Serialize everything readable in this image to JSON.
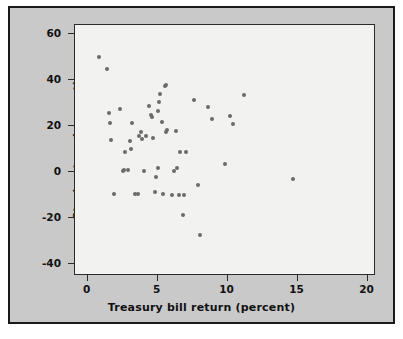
{
  "figure": {
    "background_color": "#c9c9c9",
    "plot_background_color": "#f2f2f0",
    "border_color": "#1a1a1a",
    "point_color": "#6b6b6b"
  },
  "chart_data": {
    "type": "scatter",
    "title": "",
    "xlabel": "Treasury bill return (percent)",
    "ylabel": "Stock return (percent)",
    "xlim": [
      -0.9,
      20.6
    ],
    "ylim": [
      -45,
      64
    ],
    "xticks": [
      0,
      5,
      10,
      15,
      20
    ],
    "xtick_labels": [
      "0",
      "5",
      "10",
      "15",
      "20"
    ],
    "yticks": [
      60,
      40,
      20,
      0,
      -20,
      -40
    ],
    "ytick_labels": [
      "60",
      "40",
      "20",
      "0",
      "-20",
      "-40"
    ],
    "grid": false,
    "legend": null,
    "marker": "circle",
    "n_points": 56,
    "x": [
      0.8,
      1.4,
      1.5,
      1.6,
      1.7,
      1.9,
      2.3,
      2.5,
      2.7,
      2.9,
      3.0,
      3.1,
      3.2,
      3.4,
      3.6,
      3.7,
      3.8,
      3.9,
      4.0,
      4.2,
      4.4,
      4.5,
      4.6,
      4.7,
      4.8,
      4.9,
      5.0,
      5.0,
      5.1,
      5.2,
      5.3,
      5.4,
      5.5,
      5.6,
      5.6,
      5.7,
      6.0,
      6.2,
      6.3,
      6.4,
      6.5,
      6.6,
      6.8,
      6.9,
      7.0,
      7.6,
      7.9,
      8.0,
      8.6,
      8.9,
      9.8,
      10.2,
      10.4,
      11.2,
      14.7,
      2.6
    ],
    "y": [
      50.0,
      45.0,
      26.0,
      21.5,
      14.0,
      -9.5,
      27.5,
      0.5,
      9.0,
      1.0,
      13.5,
      10.0,
      21.5,
      -9.5,
      -9.5,
      16.0,
      17.5,
      14.5,
      0.5,
      16.0,
      29.0,
      25.0,
      24.0,
      15.0,
      -8.5,
      -2.0,
      2.0,
      26.5,
      30.5,
      34.0,
      22.0,
      -9.5,
      37.5,
      38.0,
      17.5,
      18.5,
      -10.0,
      0.5,
      18.0,
      2.0,
      -10.0,
      9.0,
      -18.5,
      -10.0,
      9.0,
      31.5,
      -5.5,
      -27.0,
      28.5,
      23.0,
      3.5,
      24.5,
      21.0,
      33.5,
      -3.0,
      1.0
    ],
    "points": [
      {
        "x": 0.8,
        "y": 50.0
      },
      {
        "x": 1.4,
        "y": 45.0
      },
      {
        "x": 1.5,
        "y": 26.0
      },
      {
        "x": 1.6,
        "y": 21.5
      },
      {
        "x": 1.7,
        "y": 14.0
      },
      {
        "x": 1.9,
        "y": -9.5
      },
      {
        "x": 2.3,
        "y": 27.5
      },
      {
        "x": 2.5,
        "y": 0.5
      },
      {
        "x": 2.7,
        "y": 9.0
      },
      {
        "x": 2.9,
        "y": 1.0
      },
      {
        "x": 3.0,
        "y": 13.5
      },
      {
        "x": 3.1,
        "y": 10.0
      },
      {
        "x": 3.2,
        "y": 21.5
      },
      {
        "x": 3.4,
        "y": -9.5
      },
      {
        "x": 3.6,
        "y": -9.5
      },
      {
        "x": 3.7,
        "y": 16.0
      },
      {
        "x": 3.8,
        "y": 17.5
      },
      {
        "x": 3.9,
        "y": 14.5
      },
      {
        "x": 4.0,
        "y": 0.5
      },
      {
        "x": 4.2,
        "y": 16.0
      },
      {
        "x": 4.4,
        "y": 29.0
      },
      {
        "x": 4.5,
        "y": 25.0
      },
      {
        "x": 4.6,
        "y": 24.0
      },
      {
        "x": 4.7,
        "y": 15.0
      },
      {
        "x": 4.8,
        "y": -8.5
      },
      {
        "x": 4.9,
        "y": -2.0
      },
      {
        "x": 5.0,
        "y": 2.0
      },
      {
        "x": 5.0,
        "y": 26.5
      },
      {
        "x": 5.1,
        "y": 30.5
      },
      {
        "x": 5.2,
        "y": 34.0
      },
      {
        "x": 5.3,
        "y": 22.0
      },
      {
        "x": 5.4,
        "y": -9.5
      },
      {
        "x": 5.5,
        "y": 37.5
      },
      {
        "x": 5.6,
        "y": 38.0
      },
      {
        "x": 5.6,
        "y": 17.5
      },
      {
        "x": 5.7,
        "y": 18.5
      },
      {
        "x": 6.0,
        "y": -10.0
      },
      {
        "x": 6.2,
        "y": 0.5
      },
      {
        "x": 6.3,
        "y": 18.0
      },
      {
        "x": 6.4,
        "y": 2.0
      },
      {
        "x": 6.5,
        "y": -10.0
      },
      {
        "x": 6.6,
        "y": 9.0
      },
      {
        "x": 6.8,
        "y": -18.5
      },
      {
        "x": 6.9,
        "y": -10.0
      },
      {
        "x": 7.0,
        "y": 9.0
      },
      {
        "x": 7.6,
        "y": 31.5
      },
      {
        "x": 7.9,
        "y": -5.5
      },
      {
        "x": 8.0,
        "y": -27.0
      },
      {
        "x": 8.6,
        "y": 28.5
      },
      {
        "x": 8.9,
        "y": 23.0
      },
      {
        "x": 9.8,
        "y": 3.5
      },
      {
        "x": 10.2,
        "y": 24.5
      },
      {
        "x": 10.4,
        "y": 21.0
      },
      {
        "x": 11.2,
        "y": 33.5
      },
      {
        "x": 14.7,
        "y": -3.0
      },
      {
        "x": 2.6,
        "y": 1.0
      }
    ]
  }
}
